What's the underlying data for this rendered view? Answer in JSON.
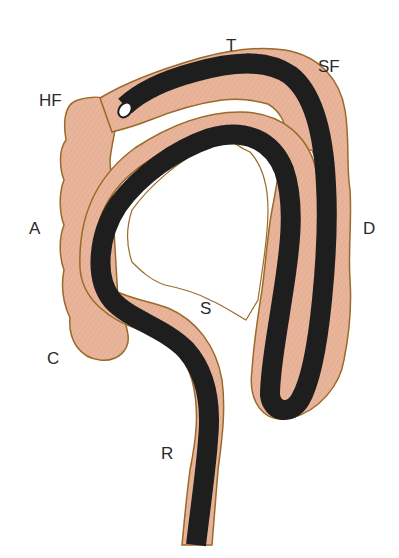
{
  "diagram": {
    "type": "anatomical-illustration",
    "colors": {
      "colon_fill": "#e8b49a",
      "colon_outline": "#9a6a2a",
      "scope": "#1e1e1e",
      "scope_tip": "#ffffff",
      "label_text": "#2a2a2a"
    },
    "labels": {
      "transverse": "T",
      "splenic_flexure": "SF",
      "hepatic_flexure": "HF",
      "ascending": "A",
      "descending": "D",
      "sigmoid": "S",
      "cecum": "C",
      "rectum": "R"
    }
  }
}
